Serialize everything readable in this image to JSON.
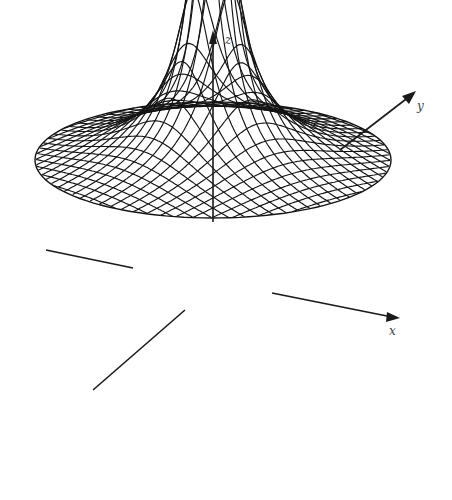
{
  "figure": {
    "surface": "z = -1/r",
    "colors": {
      "line": "#141414",
      "background": "#ffffff"
    }
  },
  "axes": {
    "z": {
      "label": "z"
    },
    "y": {
      "label": "y"
    },
    "x": {
      "label": "x"
    }
  },
  "mesh": {
    "grid_lines_per_direction": 27,
    "rim_radius": 1.0,
    "inner_radius": 0.085
  }
}
